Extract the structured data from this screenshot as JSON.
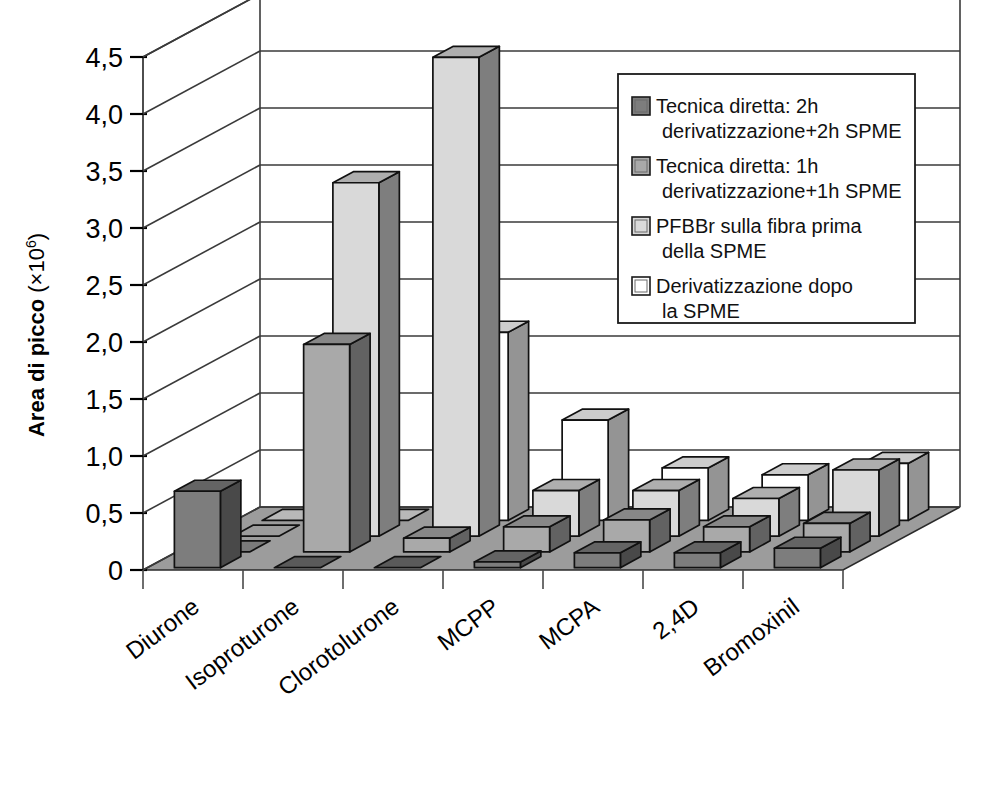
{
  "chart_data": {
    "type": "bar",
    "render": "3d-grouped-bar",
    "title": "",
    "xlabel": "",
    "ylabel": "Area di picco (×10⁶)",
    "ylabel_text": "Area di picco",
    "ylabel_sup_base": "(×10",
    "ylabel_sup_exp": "6",
    "ylabel_sup_close": ")",
    "ylim": [
      0,
      4.5
    ],
    "ytick_values": [
      0,
      0.5,
      1.0,
      1.5,
      2.0,
      2.5,
      3.0,
      3.5,
      4.0,
      4.5
    ],
    "ytick_labels": [
      "0",
      "0,5",
      "1,0",
      "1,5",
      "2,0",
      "2,5",
      "3,0",
      "3,5",
      "4,0",
      "4,5"
    ],
    "grid": true,
    "legend_position": "top-right",
    "categories": [
      "Diurone",
      "Isoproturone",
      "Clorotolurone",
      "MCPP",
      "MCPA",
      "2,4D",
      "Bromoxinil"
    ],
    "series": [
      {
        "name": "Tecnica diretta: 2h derivatizzazione+2h SPME",
        "color": "#7d7d7d",
        "values": [
          0.67,
          0.0,
          0.0,
          0.05,
          0.13,
          0.13,
          0.17
        ]
      },
      {
        "name": "Tecnica diretta: 1h derivatizzazione+1h SPME",
        "color": "#a9a9a9",
        "values": [
          0.0,
          1.82,
          0.12,
          0.22,
          0.28,
          0.22,
          0.25
        ]
      },
      {
        "name": "PFBBr sulla fibra prima della SPME",
        "color": "#d9d9d9",
        "values": [
          0.0,
          3.1,
          4.2,
          0.4,
          0.4,
          0.33,
          0.58
        ]
      },
      {
        "name": "Derivatizzazione dopo la SPME",
        "color": "#ffffff",
        "values": [
          0.0,
          0.0,
          1.65,
          0.88,
          0.46,
          0.4,
          0.5
        ]
      }
    ]
  },
  "legend": {
    "entries": [
      {
        "label_line1": "Tecnica diretta: 2h",
        "label_line2": "derivatizzazione+2h SPME",
        "color": "#7d7d7d"
      },
      {
        "label_line1": "Tecnica diretta: 1h",
        "label_line2": "derivatizzazione+1h SPME",
        "color": "#a9a9a9"
      },
      {
        "label_line1": "PFBBr sulla fibra prima",
        "label_line2": "della SPME",
        "color": "#d9d9d9"
      },
      {
        "label_line1": "Derivatizzazione dopo",
        "label_line2": "la SPME",
        "color": "#ffffff"
      }
    ]
  },
  "colors": {
    "floor": "#9c9c9c",
    "axis": "#3a3a3a",
    "outline": "#111111",
    "background": "#ffffff"
  }
}
